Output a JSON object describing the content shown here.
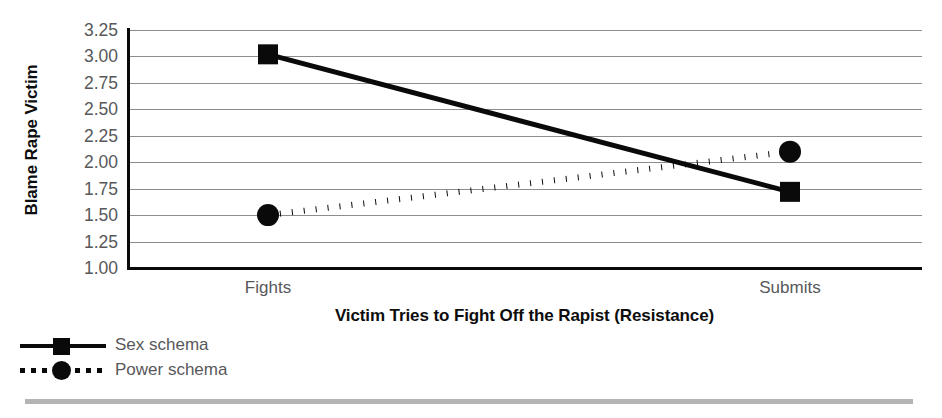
{
  "chart_data": {
    "type": "line",
    "title": "",
    "xlabel": "Victim Tries to Fight Off the Rapist (Resistance)",
    "ylabel": "Blame Rape Victim",
    "categories": [
      "Fights",
      "Submits"
    ],
    "ylim": [
      1.0,
      3.25
    ],
    "yticks": [
      "3.25",
      "3.00",
      "2.75",
      "2.50",
      "2.25",
      "2.00",
      "1.75",
      "1.50",
      "1.25",
      "1.00"
    ],
    "ytick_values": [
      3.25,
      3.0,
      2.75,
      2.5,
      2.25,
      2.0,
      1.75,
      1.5,
      1.25,
      1.0
    ],
    "grid": true,
    "legend_position": "below-left",
    "series": [
      {
        "name": "Sex schema",
        "values": [
          3.02,
          1.72
        ],
        "marker": "square",
        "line_style": "solid",
        "color": "#0a0a0a"
      },
      {
        "name": "Power schema",
        "values": [
          1.5,
          2.1
        ],
        "marker": "circle",
        "line_style": "dotted",
        "color": "#0a0a0a"
      }
    ]
  },
  "legend": {
    "items": [
      {
        "label": "Sex schema"
      },
      {
        "label": "Power schema"
      }
    ]
  },
  "axis": {
    "ytick_0": "3.25",
    "ytick_1": "3.00",
    "ytick_2": "2.75",
    "ytick_3": "2.50",
    "ytick_4": "2.25",
    "ytick_5": "2.00",
    "ytick_6": "1.75",
    "ytick_7": "1.50",
    "ytick_8": "1.25",
    "ytick_9": "1.00",
    "xtick_0": "Fights",
    "xtick_1": "Submits"
  }
}
